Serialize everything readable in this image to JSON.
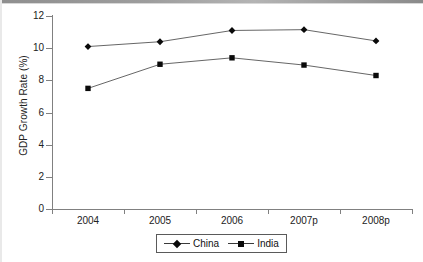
{
  "chart_data": {
    "type": "line",
    "title": "",
    "xlabel": "",
    "ylabel": "GDP Growth Rate (%)",
    "categories": [
      "2004",
      "2005",
      "2006",
      "2007p",
      "2008p"
    ],
    "ylim": [
      0,
      12
    ],
    "ytick_labels": [
      "0",
      "2",
      "4",
      "6",
      "8",
      "10",
      "12"
    ],
    "ytick_values": [
      0,
      2,
      4,
      6,
      8,
      10,
      12
    ],
    "grid": false,
    "legend_position": "bottom-center",
    "series": [
      {
        "name": "China",
        "marker": "diamond",
        "color": "#0a0a0a",
        "values": [
          10.1,
          10.4,
          11.1,
          11.15,
          10.45
        ]
      },
      {
        "name": "India",
        "marker": "square",
        "color": "#0a0a0a",
        "values": [
          7.5,
          9.0,
          9.4,
          8.95,
          8.3
        ]
      }
    ]
  },
  "legend": {
    "entries": [
      {
        "label": "China"
      },
      {
        "label": "India"
      }
    ]
  },
  "axis": {
    "y_title": "GDP Growth Rate (%)"
  }
}
